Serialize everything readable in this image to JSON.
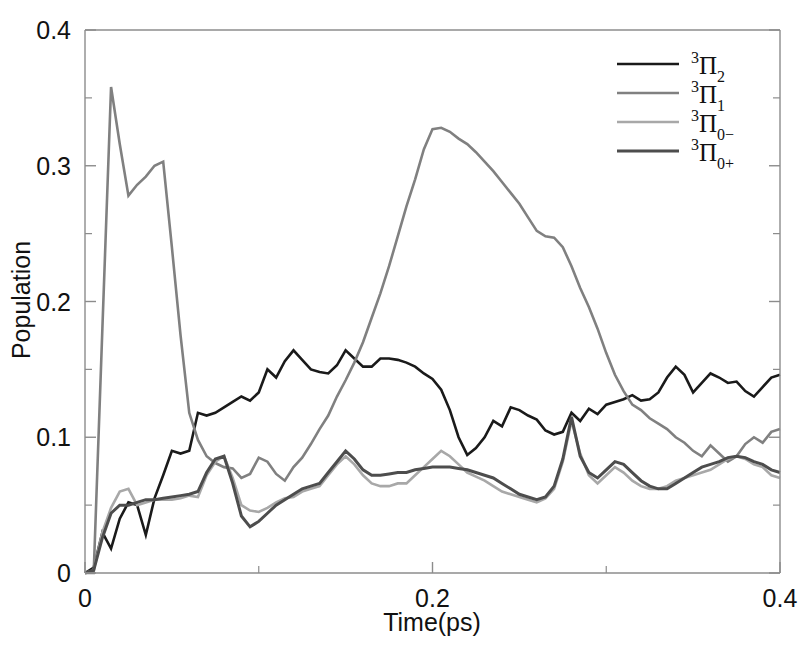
{
  "figure": {
    "background": "#ffffff",
    "plot_area": {
      "left": 85,
      "right": 780,
      "top": 30,
      "bottom": 573
    }
  },
  "chart_data": {
    "type": "line",
    "title": "",
    "xlabel": "Time(ps)",
    "ylabel": "Population",
    "xlim": [
      0,
      0.4
    ],
    "ylim": [
      0,
      0.4
    ],
    "xticks": [
      0,
      0.2,
      0.4
    ],
    "xticklabels": [
      "0",
      "0.2",
      "0.4"
    ],
    "xticks_minor": [
      0.1,
      0.3
    ],
    "yticks": [
      0,
      0.1,
      0.2,
      0.3,
      0.4
    ],
    "yticklabels": [
      "0",
      "0.1",
      "0.2",
      "0.3",
      "0.4"
    ],
    "yticks_minor": [
      0.05,
      0.15,
      0.25,
      0.35
    ],
    "grid": false,
    "legend_position": "top-right",
    "x": [
      0,
      0.005,
      0.01,
      0.015,
      0.02,
      0.025,
      0.03,
      0.035,
      0.04,
      0.045,
      0.05,
      0.055,
      0.06,
      0.065,
      0.07,
      0.075,
      0.08,
      0.085,
      0.09,
      0.095,
      0.1,
      0.105,
      0.11,
      0.115,
      0.12,
      0.125,
      0.13,
      0.135,
      0.14,
      0.145,
      0.15,
      0.155,
      0.16,
      0.165,
      0.17,
      0.175,
      0.18,
      0.185,
      0.19,
      0.195,
      0.2,
      0.205,
      0.21,
      0.215,
      0.22,
      0.225,
      0.23,
      0.235,
      0.24,
      0.245,
      0.25,
      0.255,
      0.26,
      0.265,
      0.27,
      0.275,
      0.28,
      0.285,
      0.29,
      0.295,
      0.3,
      0.305,
      0.31,
      0.315,
      0.32,
      0.325,
      0.33,
      0.335,
      0.34,
      0.345,
      0.35,
      0.355,
      0.36,
      0.365,
      0.37,
      0.375,
      0.38,
      0.385,
      0.39,
      0.395,
      0.4
    ],
    "series": [
      {
        "name": "3Pi2",
        "label_base": "Π",
        "label_sup": "3",
        "label_sub": "2",
        "color": "#1a1a1a",
        "linewidth": 2.6,
        "values": [
          0.0,
          0.004,
          0.03,
          0.018,
          0.04,
          0.052,
          0.05,
          0.028,
          0.055,
          0.072,
          0.09,
          0.088,
          0.09,
          0.118,
          0.116,
          0.118,
          0.122,
          0.126,
          0.13,
          0.127,
          0.133,
          0.15,
          0.144,
          0.156,
          0.164,
          0.157,
          0.15,
          0.148,
          0.147,
          0.153,
          0.164,
          0.158,
          0.152,
          0.152,
          0.158,
          0.158,
          0.157,
          0.155,
          0.152,
          0.147,
          0.143,
          0.135,
          0.12,
          0.1,
          0.087,
          0.092,
          0.1,
          0.112,
          0.108,
          0.122,
          0.12,
          0.116,
          0.113,
          0.105,
          0.102,
          0.104,
          0.118,
          0.112,
          0.121,
          0.117,
          0.124,
          0.126,
          0.128,
          0.131,
          0.127,
          0.128,
          0.133,
          0.144,
          0.152,
          0.146,
          0.133,
          0.14,
          0.147,
          0.144,
          0.14,
          0.141,
          0.134,
          0.13,
          0.137,
          0.144,
          0.146
        ]
      },
      {
        "name": "3Pi1",
        "label_base": "Π",
        "label_sup": "3",
        "label_sub": "1",
        "color": "#808080",
        "linewidth": 2.6,
        "values": [
          0.0,
          0.0,
          0.18,
          0.358,
          0.316,
          0.278,
          0.286,
          0.292,
          0.3,
          0.303,
          0.24,
          0.175,
          0.118,
          0.098,
          0.086,
          0.081,
          0.078,
          0.077,
          0.07,
          0.073,
          0.085,
          0.082,
          0.073,
          0.068,
          0.078,
          0.085,
          0.095,
          0.106,
          0.116,
          0.13,
          0.142,
          0.155,
          0.17,
          0.188,
          0.206,
          0.226,
          0.248,
          0.27,
          0.29,
          0.312,
          0.327,
          0.328,
          0.325,
          0.32,
          0.316,
          0.31,
          0.303,
          0.296,
          0.288,
          0.28,
          0.272,
          0.262,
          0.252,
          0.248,
          0.247,
          0.24,
          0.226,
          0.21,
          0.196,
          0.18,
          0.162,
          0.146,
          0.134,
          0.124,
          0.12,
          0.114,
          0.11,
          0.106,
          0.1,
          0.096,
          0.09,
          0.086,
          0.094,
          0.088,
          0.082,
          0.086,
          0.095,
          0.1,
          0.096,
          0.104,
          0.106
        ]
      },
      {
        "name": "3Pi0-",
        "label_base": "Π",
        "label_sup": "3",
        "label_sub": "0−",
        "color": "#a8a8a8",
        "linewidth": 2.6,
        "values": [
          0.0,
          0.002,
          0.03,
          0.048,
          0.06,
          0.062,
          0.05,
          0.052,
          0.054,
          0.054,
          0.054,
          0.055,
          0.057,
          0.056,
          0.072,
          0.082,
          0.086,
          0.07,
          0.05,
          0.046,
          0.045,
          0.048,
          0.052,
          0.055,
          0.056,
          0.06,
          0.062,
          0.064,
          0.072,
          0.08,
          0.086,
          0.08,
          0.072,
          0.066,
          0.064,
          0.064,
          0.066,
          0.066,
          0.072,
          0.078,
          0.084,
          0.09,
          0.086,
          0.08,
          0.074,
          0.071,
          0.068,
          0.064,
          0.06,
          0.058,
          0.056,
          0.054,
          0.052,
          0.055,
          0.062,
          0.082,
          0.112,
          0.088,
          0.072,
          0.066,
          0.072,
          0.078,
          0.074,
          0.068,
          0.064,
          0.062,
          0.062,
          0.064,
          0.068,
          0.07,
          0.072,
          0.074,
          0.076,
          0.08,
          0.084,
          0.086,
          0.084,
          0.08,
          0.078,
          0.072,
          0.07
        ]
      },
      {
        "name": "3Pi0+",
        "label_base": "Π",
        "label_sup": "3",
        "label_sub": "0+",
        "color": "#4d4d4d",
        "linewidth": 3.0,
        "values": [
          0.0,
          0.002,
          0.026,
          0.044,
          0.05,
          0.05,
          0.052,
          0.054,
          0.054,
          0.055,
          0.056,
          0.057,
          0.058,
          0.06,
          0.074,
          0.084,
          0.086,
          0.066,
          0.042,
          0.034,
          0.038,
          0.044,
          0.05,
          0.054,
          0.058,
          0.062,
          0.064,
          0.066,
          0.074,
          0.082,
          0.09,
          0.084,
          0.076,
          0.072,
          0.072,
          0.073,
          0.074,
          0.074,
          0.076,
          0.077,
          0.078,
          0.078,
          0.078,
          0.077,
          0.076,
          0.074,
          0.072,
          0.07,
          0.066,
          0.062,
          0.058,
          0.056,
          0.054,
          0.056,
          0.064,
          0.084,
          0.115,
          0.086,
          0.074,
          0.07,
          0.076,
          0.082,
          0.08,
          0.074,
          0.068,
          0.064,
          0.062,
          0.062,
          0.066,
          0.07,
          0.074,
          0.078,
          0.08,
          0.082,
          0.085,
          0.086,
          0.085,
          0.082,
          0.08,
          0.076,
          0.074
        ]
      }
    ]
  }
}
